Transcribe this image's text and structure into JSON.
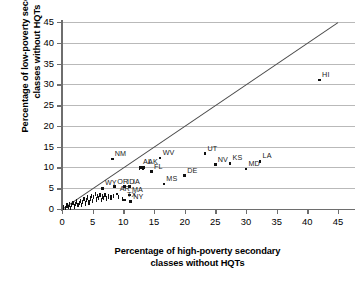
{
  "chart_data": {
    "type": "scatter",
    "title": "",
    "xlabel": "Percentage of high-poverty secondary classes without HQTs",
    "ylabel": "Percentage of low-poverty secondary classes without HQTs",
    "xlabel_line1": "Percentage of high-poverty secondary",
    "xlabel_line2": "classes without HQTs",
    "ylabel_line1": "Percentage of low-poverty secondary",
    "ylabel_line2": "classes without HQTs",
    "xlim": [
      0,
      45
    ],
    "ylim": [
      0,
      45
    ],
    "xticks": [
      0,
      5,
      10,
      15,
      20,
      25,
      30,
      35,
      40,
      45
    ],
    "yticks": [
      0,
      5,
      10,
      15,
      20,
      25,
      30,
      35,
      40,
      45
    ],
    "grid": "horizontal",
    "legend": "none",
    "reference_line": {
      "type": "identity",
      "equation": "y = x",
      "from": [
        0,
        0
      ],
      "to": [
        45,
        45
      ]
    },
    "gridline_color": "#b9b9b9",
    "axis_color": "#6e6e6e",
    "marker_color": "#111111",
    "points": [
      {
        "label": "HI",
        "x": 42.0,
        "y": 31.0,
        "label_dx": 0,
        "label_dy": -1
      },
      {
        "label": "UT",
        "x": 23.3,
        "y": 13.3,
        "label_dx": 0,
        "label_dy": -1
      },
      {
        "label": "WV",
        "x": 16.0,
        "y": 12.3,
        "label_dx": 0,
        "label_dy": -1
      },
      {
        "label": "NM",
        "x": 8.2,
        "y": 12.0,
        "label_dx": 0,
        "label_dy": -1
      },
      {
        "label": "LA",
        "x": 32.3,
        "y": 11.5,
        "label_dx": 0,
        "label_dy": -1
      },
      {
        "label": "KS",
        "x": 27.4,
        "y": 11.0,
        "label_dx": 0,
        "label_dy": -1
      },
      {
        "label": "NV",
        "x": 25.0,
        "y": 10.7,
        "label_dx": 0,
        "label_dy": -1
      },
      {
        "label": "MD",
        "x": 30.0,
        "y": 9.6,
        "label_dx": 0,
        "label_dy": -1
      },
      {
        "label": "AL",
        "x": 12.8,
        "y": 10.0,
        "label_dx": 0,
        "label_dy": -1
      },
      {
        "label": "AK",
        "x": 13.3,
        "y": 10.0,
        "label_dx": 2,
        "label_dy": -1
      },
      {
        "label": "FL",
        "x": 14.6,
        "y": 9.0,
        "label_dx": 0,
        "label_dy": -1
      },
      {
        "label": "DE",
        "x": 20.0,
        "y": 8.0,
        "label_dx": 0,
        "label_dy": -1
      },
      {
        "label": "MS",
        "x": 16.6,
        "y": 6.0,
        "label_dx": 0,
        "label_dy": -1
      },
      {
        "label": "OR",
        "x": 8.6,
        "y": 5.4,
        "label_dx": 0,
        "label_dy": -1
      },
      {
        "label": "ID",
        "x": 10.2,
        "y": 5.4,
        "label_dx": 0,
        "label_dy": -1
      },
      {
        "label": "IA",
        "x": 11.0,
        "y": 5.4,
        "label_dx": 1,
        "label_dy": -1
      },
      {
        "label": "WY",
        "x": 6.6,
        "y": 5.0,
        "label_dx": 0,
        "label_dy": -1
      },
      {
        "label": "MA",
        "x": 11.0,
        "y": 3.4,
        "label_dx": 0,
        "label_dy": -1
      },
      {
        "label": "AR",
        "x": 9.0,
        "y": 3.6,
        "label_dx": 0,
        "label_dy": -1
      },
      {
        "label": "TX",
        "x": 10.2,
        "y": 2.2,
        "label_dx": 0,
        "label_dy": -1
      },
      {
        "label": "NY",
        "x": 11.2,
        "y": 1.8,
        "label_dx": 0,
        "label_dy": -1
      },
      {
        "label": "",
        "x": 0.3,
        "y": 0.4
      },
      {
        "label": "",
        "x": 0.6,
        "y": 0.2
      },
      {
        "label": "",
        "x": 0.8,
        "y": 0.8
      },
      {
        "label": "",
        "x": 1.0,
        "y": 0.5
      },
      {
        "label": "",
        "x": 1.2,
        "y": 1.1
      },
      {
        "label": "",
        "x": 1.4,
        "y": 0.3
      },
      {
        "label": "",
        "x": 1.6,
        "y": 0.9
      },
      {
        "label": "",
        "x": 1.8,
        "y": 1.4
      },
      {
        "label": "",
        "x": 2.0,
        "y": 0.6
      },
      {
        "label": "",
        "x": 2.2,
        "y": 1.2
      },
      {
        "label": "",
        "x": 2.4,
        "y": 1.8
      },
      {
        "label": "",
        "x": 2.6,
        "y": 0.9
      },
      {
        "label": "",
        "x": 2.8,
        "y": 1.5
      },
      {
        "label": "",
        "x": 3.0,
        "y": 2.0
      },
      {
        "label": "",
        "x": 3.2,
        "y": 1.0
      },
      {
        "label": "",
        "x": 3.4,
        "y": 1.7
      },
      {
        "label": "",
        "x": 3.6,
        "y": 2.4
      },
      {
        "label": "",
        "x": 3.8,
        "y": 1.3
      },
      {
        "label": "",
        "x": 4.0,
        "y": 2.1
      },
      {
        "label": "",
        "x": 4.2,
        "y": 2.8
      },
      {
        "label": "",
        "x": 4.4,
        "y": 1.6
      },
      {
        "label": "",
        "x": 4.6,
        "y": 2.5
      },
      {
        "label": "",
        "x": 4.8,
        "y": 3.2
      },
      {
        "label": "",
        "x": 5.0,
        "y": 2.0
      },
      {
        "label": "",
        "x": 5.2,
        "y": 2.9
      },
      {
        "label": "",
        "x": 5.4,
        "y": 3.6
      },
      {
        "label": "",
        "x": 5.6,
        "y": 2.3
      },
      {
        "label": "",
        "x": 5.8,
        "y": 3.1
      },
      {
        "label": "",
        "x": 6.0,
        "y": 2.6
      },
      {
        "label": "",
        "x": 6.2,
        "y": 3.4
      },
      {
        "label": "",
        "x": 6.4,
        "y": 2.2
      },
      {
        "label": "",
        "x": 6.6,
        "y": 3.0
      },
      {
        "label": "",
        "x": 6.8,
        "y": 2.7
      },
      {
        "label": "",
        "x": 7.0,
        "y": 3.3
      },
      {
        "label": "",
        "x": 7.2,
        "y": 2.5
      },
      {
        "label": "",
        "x": 7.6,
        "y": 3.0
      },
      {
        "label": "",
        "x": 8.0,
        "y": 2.8
      },
      {
        "label": "",
        "x": 8.4,
        "y": 3.2
      },
      {
        "label": "",
        "x": 9.2,
        "y": 2.9
      },
      {
        "label": "",
        "x": 9.8,
        "y": 2.4
      },
      {
        "label": "",
        "x": 12.6,
        "y": 9.9
      },
      {
        "label": "",
        "x": 13.2,
        "y": 9.9
      }
    ]
  }
}
